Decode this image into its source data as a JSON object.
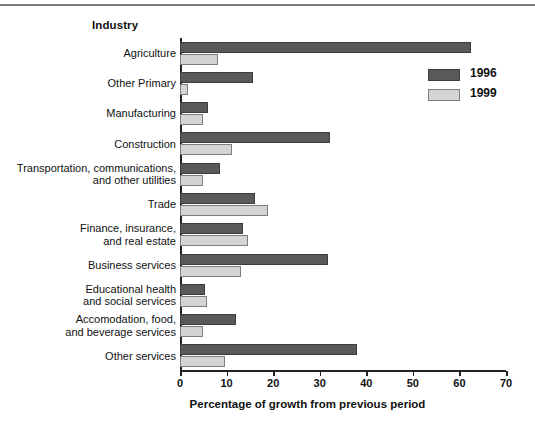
{
  "chart_data": {
    "type": "bar",
    "orientation": "horizontal",
    "title": "",
    "ylabel": "Industry",
    "xlabel": "Percentage of growth from previous period",
    "xlim": [
      0,
      70
    ],
    "xticks": [
      0,
      10,
      20,
      30,
      40,
      50,
      60,
      70
    ],
    "grid": false,
    "legend_position": "top-right",
    "categories": [
      "Agriculture",
      "Other Primary",
      "Manufacturing",
      "Construction",
      "Transportation, communications,\nand other utilities",
      "Trade",
      "Finance, insurance,\nand real estate",
      "Business services",
      "Educational health\nand social services",
      "Accomodation, food,\nand beverage services",
      "Other services"
    ],
    "series": [
      {
        "name": "1996",
        "color": "#595959",
        "values": [
          62.5,
          15.7,
          6.0,
          32.3,
          8.6,
          16.0,
          13.6,
          31.8,
          5.4,
          12.0,
          38.0
        ]
      },
      {
        "name": "1999",
        "color": "#d4d4d4",
        "values": [
          8.2,
          1.8,
          5.0,
          11.2,
          5.0,
          19.0,
          14.5,
          13.0,
          5.8,
          5.0,
          9.7
        ]
      }
    ]
  },
  "legend": {
    "items": [
      {
        "label": "1996"
      },
      {
        "label": "1999"
      }
    ]
  },
  "colors": {
    "series_1996": "#595959",
    "series_1999": "#d4d4d4",
    "axis": "#222222",
    "rule": "#7a7a7a",
    "text": "#111111",
    "background": "#ffffff"
  }
}
